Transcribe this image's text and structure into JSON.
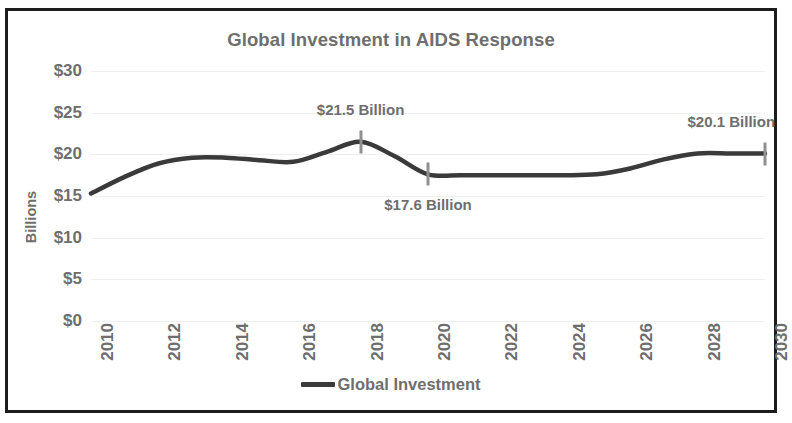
{
  "chart_data": {
    "type": "line",
    "title": "Global Investment in AIDS Response",
    "xlabel": "",
    "ylabel": "Billions",
    "grid": true,
    "legend_position": "bottom",
    "xlim": [
      2010,
      2030
    ],
    "ylim": [
      0,
      30
    ],
    "x_tick_labels": [
      "2010",
      "2012",
      "2014",
      "2016",
      "2018",
      "2020",
      "2022",
      "2024",
      "2026",
      "2028",
      "2030"
    ],
    "x_tick_values": [
      2010,
      2012,
      2014,
      2016,
      2018,
      2020,
      2022,
      2024,
      2026,
      2028,
      2030
    ],
    "y_tick_labels": [
      "$30",
      "$25",
      "$20",
      "$15",
      "$10",
      "$5",
      "$0"
    ],
    "y_tick_values": [
      30,
      25,
      20,
      15,
      10,
      5,
      0
    ],
    "series": [
      {
        "name": "Global Investment",
        "color": "#3a3a3a",
        "x": [
          2010,
          2011,
          2012,
          2013,
          2014,
          2015,
          2016,
          2017,
          2018,
          2019,
          2020,
          2021,
          2022,
          2023,
          2024,
          2025,
          2026,
          2027,
          2028,
          2029,
          2030
        ],
        "values": [
          15.3,
          17.3,
          18.9,
          19.6,
          19.6,
          19.3,
          19.1,
          20.3,
          21.5,
          19.8,
          17.6,
          17.5,
          17.5,
          17.5,
          17.5,
          17.6,
          18.3,
          19.4,
          20.1,
          20.1,
          20.1
        ]
      }
    ],
    "markers": [
      {
        "x": 2018,
        "y": 21.5
      },
      {
        "x": 2020,
        "y": 17.6
      },
      {
        "x": 2030,
        "y": 20.1
      }
    ],
    "annotations": [
      {
        "label": "$21.5 Billion",
        "x": 2018,
        "y": 21.5,
        "position": "above"
      },
      {
        "label": "$17.6 Billion",
        "x": 2020,
        "y": 17.6,
        "position": "below"
      },
      {
        "label": "$20.1 Billion",
        "x": 2029,
        "y": 20.1,
        "position": "above"
      }
    ]
  },
  "legend": {
    "items": [
      {
        "label": "Global Investment",
        "color": "#3a3a3a"
      }
    ]
  }
}
